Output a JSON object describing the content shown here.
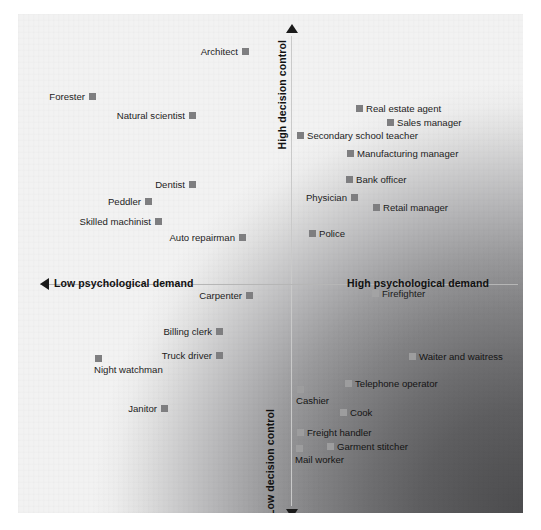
{
  "figure": {
    "background_color": "#f2f2f2",
    "marker_color": "#7e7e80",
    "axis_color": "#c9c9c9",
    "shading_dark_color": "#4c4c4e"
  },
  "axes": {
    "vertical_top_label": "High decision control",
    "vertical_bottom_label": "Low decision control",
    "horizontal_left_label": "Low psychological demand",
    "horizontal_right_label": "High psychological demand"
  },
  "chart_data": {
    "type": "scatter",
    "title": "",
    "xlabel": "Psychological demand",
    "ylabel": "Decision control",
    "xlim": [
      0,
      100
    ],
    "ylim": [
      0,
      100
    ],
    "grid": false,
    "legend": null,
    "annotations": [
      "High decision control",
      "Low decision control",
      "Low psychological demand",
      "High psychological demand"
    ],
    "quadrants": {
      "top_left": "Low psychological demand / High decision control",
      "top_right": "High psychological demand / High decision control",
      "bottom_left": "Low psychological demand / Low decision control",
      "bottom_right": "High psychological demand / Low decision control"
    },
    "points": [
      {
        "label": "Architect",
        "x": 245,
        "y": 51,
        "side": "left",
        "zone": "light"
      },
      {
        "label": "Forester",
        "x": 92,
        "y": 96,
        "side": "left",
        "zone": "light"
      },
      {
        "label": "Natural scientist",
        "x": 192,
        "y": 115,
        "side": "left",
        "zone": "light"
      },
      {
        "label": "Real estate agent",
        "x": 359,
        "y": 108,
        "side": "right",
        "zone": "light"
      },
      {
        "label": "Sales manager",
        "x": 390,
        "y": 122,
        "side": "right",
        "zone": "light"
      },
      {
        "label": "Secondary school teacher",
        "x": 300,
        "y": 135,
        "side": "right",
        "zone": "light"
      },
      {
        "label": "Manufacturing manager",
        "x": 350,
        "y": 153,
        "side": "right",
        "zone": "light"
      },
      {
        "label": "Dentist",
        "x": 192,
        "y": 184,
        "side": "left",
        "zone": "light"
      },
      {
        "label": "Bank officer",
        "x": 349,
        "y": 179,
        "side": "right",
        "zone": "light"
      },
      {
        "label": "Physician",
        "x": 354,
        "y": 197,
        "side": "left",
        "zone": "light"
      },
      {
        "label": "Peddler",
        "x": 148,
        "y": 201,
        "side": "left",
        "zone": "light"
      },
      {
        "label": "Retail manager",
        "x": 376,
        "y": 207,
        "side": "right",
        "zone": "light"
      },
      {
        "label": "Skilled machinist",
        "x": 158,
        "y": 221,
        "side": "left",
        "zone": "light"
      },
      {
        "label": "Auto repairman",
        "x": 242,
        "y": 237,
        "side": "left",
        "zone": "light"
      },
      {
        "label": "Police",
        "x": 312,
        "y": 233,
        "side": "right",
        "zone": "light"
      },
      {
        "label": "Carpenter",
        "x": 249,
        "y": 295,
        "side": "left",
        "zone": "light"
      },
      {
        "label": "Firefighter",
        "x": 375,
        "y": 293,
        "side": "right",
        "zone": "dark"
      },
      {
        "label": "Billing clerk",
        "x": 219,
        "y": 331,
        "side": "left",
        "zone": "light"
      },
      {
        "label": "Truck driver",
        "x": 219,
        "y": 355,
        "side": "left",
        "zone": "light"
      },
      {
        "label": "Night watchman",
        "x": 98,
        "y": 358,
        "side": "below",
        "zone": "light"
      },
      {
        "label": "Waiter and waitress",
        "x": 412,
        "y": 356,
        "side": "right",
        "zone": "deep"
      },
      {
        "label": "Telephone operator",
        "x": 348,
        "y": 383,
        "side": "right",
        "zone": "deep"
      },
      {
        "label": "Cashier",
        "x": 300,
        "y": 389,
        "side": "below",
        "zone": "deep"
      },
      {
        "label": "Janitor",
        "x": 164,
        "y": 408,
        "side": "left",
        "zone": "light"
      },
      {
        "label": "Cook",
        "x": 343,
        "y": 412,
        "side": "right",
        "zone": "deep"
      },
      {
        "label": "Freight handler",
        "x": 300,
        "y": 432,
        "side": "right",
        "zone": "deep"
      },
      {
        "label": "Garment stitcher",
        "x": 330,
        "y": 446,
        "side": "right",
        "zone": "deep"
      },
      {
        "label": "Mail worker",
        "x": 299,
        "y": 448,
        "side": "below",
        "zone": "deep"
      }
    ]
  }
}
